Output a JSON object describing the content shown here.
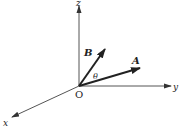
{
  "diagram": {
    "type": "3d-coordinate-vectors",
    "origin_label": "O",
    "axes": [
      {
        "name": "x",
        "label": "x"
      },
      {
        "name": "y",
        "label": "y"
      },
      {
        "name": "z",
        "label": "z"
      }
    ],
    "vectors": [
      {
        "name": "A",
        "label": "A"
      },
      {
        "name": "B",
        "label": "B"
      }
    ],
    "angle_label": "θ",
    "colors": {
      "line": "#555555",
      "vector": "#222222",
      "background": "#ffffff"
    }
  }
}
